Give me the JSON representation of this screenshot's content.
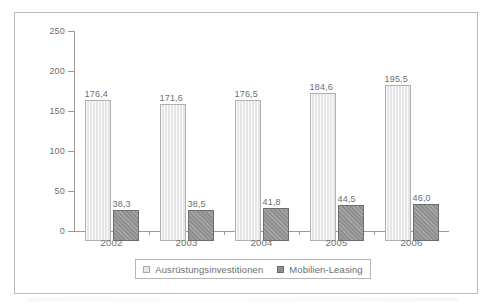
{
  "chart_data": {
    "type": "bar",
    "title": "",
    "subtitle": "",
    "xlabel": "",
    "ylabel": "",
    "categories": [
      "2002",
      "2003",
      "2004",
      "2005",
      "2006"
    ],
    "ylim": [
      0,
      250
    ],
    "yticks": [
      0,
      50,
      100,
      150,
      200,
      250
    ],
    "ytick_labels": [
      "0",
      "50",
      "100",
      "150",
      "200",
      "250"
    ],
    "grid": false,
    "legend_position": "bottom-center",
    "series": [
      {
        "name": "Ausrüstungsinvestitionen",
        "color": "#e6e6e6",
        "values": [
          176.4,
          171.6,
          176.5,
          184.6,
          195.5
        ],
        "value_labels": [
          "176,4",
          "171,6",
          "176,5",
          "184,6",
          "195,5"
        ]
      },
      {
        "name": "Mobilien-Leasing",
        "color": "#8f8f8f",
        "values": [
          38.3,
          38.5,
          41.8,
          44.5,
          46.0
        ],
        "value_labels": [
          "38,3",
          "38,5",
          "41,8",
          "44,5",
          "46,0"
        ]
      }
    ]
  },
  "legend": {
    "entries": [
      {
        "label": "Ausrüstungsinvestitionen",
        "swatch": "light-square-icon"
      },
      {
        "label": "Mobilien-Leasing",
        "swatch": "dark-square-icon"
      }
    ]
  }
}
